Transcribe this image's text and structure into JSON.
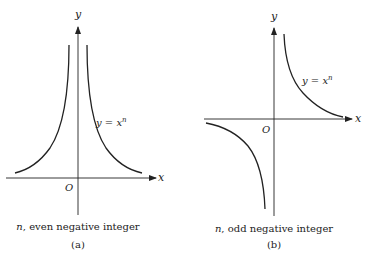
{
  "panels": [
    {
      "id": "a",
      "x_label": "x",
      "y_label": "y",
      "origin_label": "O",
      "curve_label": "y = x^n",
      "curve_label_base": "y = x",
      "curve_label_exp": "n",
      "caption_var": "n",
      "caption_text": ", even negative integer",
      "sub_label": "(a)"
    },
    {
      "id": "b",
      "x_label": "x",
      "y_label": "y",
      "origin_label": "O",
      "curve_label": "y = x^n",
      "curve_label_base": "y = x",
      "curve_label_exp": "n",
      "caption_var": "n",
      "caption_text": ", odd negative integer",
      "sub_label": "(b)"
    }
  ],
  "colors": {
    "ink": "#222222",
    "background": "#ffffff"
  }
}
